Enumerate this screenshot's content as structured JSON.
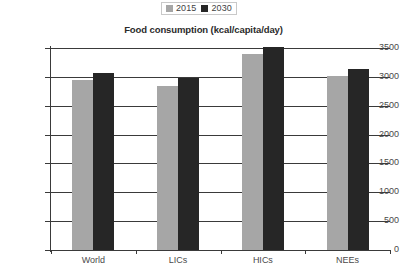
{
  "chart_data": {
    "type": "bar",
    "title": "Food consumption (kcal/capita/day)",
    "xlabel": "",
    "ylabel": "",
    "categories": [
      "World",
      "LICs",
      "HICs",
      "NEEs"
    ],
    "series": [
      {
        "name": "2015",
        "color": "#a6a6a6",
        "values": [
          2950,
          2840,
          3390,
          3020
        ]
      },
      {
        "name": "2030",
        "color": "#262626",
        "values": [
          3070,
          2980,
          3520,
          3140
        ]
      }
    ],
    "ylim": [
      0,
      3500
    ],
    "ytick_step": 500,
    "yticks": [
      3500,
      3000,
      2500,
      2000,
      1500,
      1000,
      500,
      0
    ],
    "ytick_labels": [
      "3500",
      "3000",
      "2500",
      "2000",
      "1500",
      "1000",
      "500",
      "0"
    ],
    "grid": true,
    "legend_position": "top-center",
    "legend": [
      {
        "label": "2015",
        "swatch": "#a6a6a6"
      },
      {
        "label": "2030",
        "swatch": "#262626"
      }
    ]
  }
}
